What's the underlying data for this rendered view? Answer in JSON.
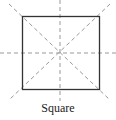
{
  "diagram": {
    "title": "Square",
    "shape": "square",
    "square": {
      "x": 22,
      "y": 16,
      "size": 77,
      "stroke": "#333333"
    },
    "symmetry_lines": {
      "count": 4,
      "style": "dashed",
      "color": "#999999",
      "lines": [
        {
          "name": "horizontal",
          "x1": 0,
          "y1": 53,
          "x2": 116,
          "y2": 53
        },
        {
          "name": "vertical",
          "x1": 60,
          "y1": 0,
          "x2": 60,
          "y2": 101
        },
        {
          "name": "diagonal-main",
          "x1": 9,
          "y1": 4,
          "x2": 110,
          "y2": 100
        },
        {
          "name": "diagonal-anti",
          "x1": 110,
          "y1": 4,
          "x2": 9,
          "y2": 100
        }
      ]
    }
  }
}
